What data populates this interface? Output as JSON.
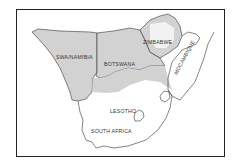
{
  "map": {
    "title": "",
    "colors": {
      "background": "#ffffff",
      "shaded": "#d2d2d2",
      "border": "#333333",
      "frame": "#222222"
    },
    "regions": [
      {
        "name": "SWA/NAMIBIA",
        "shaded": true
      },
      {
        "name": "BOTSWANA",
        "shaded": true
      },
      {
        "name": "ZIMBABWE",
        "shaded": true
      },
      {
        "name": "MOCAMBIQUE",
        "shaded": false
      },
      {
        "name": "LESOTHO",
        "shaded": false
      },
      {
        "name": "SOUTH AFRICA",
        "shaded": false
      }
    ],
    "labels": {
      "namibia": "SWA/NAMIBIA",
      "botswana": "BOTSWANA",
      "zimbabwe": "ZIMBABWE",
      "mozambique": "MOCAMBIQUE",
      "lesotho": "LESOTHO",
      "south_africa": "SOUTH AFRICA"
    }
  }
}
